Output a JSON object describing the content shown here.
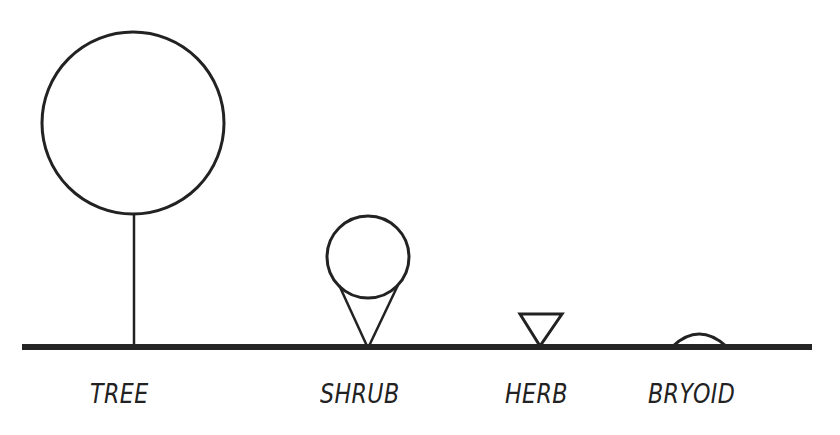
{
  "diagram": {
    "title": "",
    "colors": {
      "stroke": "#222222",
      "ground": "#252525",
      "background": "#ffffff"
    },
    "ground": {
      "x1": 22,
      "x2": 812,
      "y": 347
    },
    "forms": [
      {
        "id": "tree",
        "label": "TREE",
        "symbol": "large circle on a vertical stem"
      },
      {
        "id": "shrub",
        "label": "SHRUB",
        "symbol": "medium circle on an inverted cone"
      },
      {
        "id": "herb",
        "label": "HERB",
        "symbol": "inverted triangle"
      },
      {
        "id": "bryoid",
        "label": "BRYOID",
        "symbol": "low dome arc"
      }
    ]
  }
}
